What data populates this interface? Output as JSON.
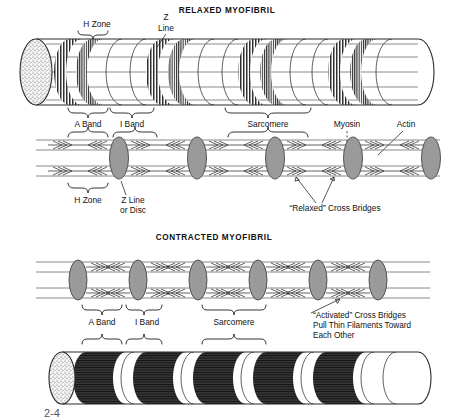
{
  "figure": {
    "number": "2-4"
  },
  "panels": {
    "relaxed": {
      "title": "RELAXED MYOFIBRIL",
      "labels": {
        "h_zone_top": "H Zone",
        "z_line_top_1": "Z",
        "z_line_top_2": "Line",
        "a_band": "A Band",
        "i_band": "I Band",
        "sarcomere": "Sarcomere",
        "myosin": "Myosin",
        "actin": "Actin",
        "h_zone_bottom": "H Zone",
        "z_line_bottom_1": "Z Line",
        "z_line_bottom_2": "or Disc",
        "cross_bridges": "“Relaxed” Cross Bridges"
      }
    },
    "contracted": {
      "title": "CONTRACTED MYOFIBRIL",
      "labels": {
        "a_band": "A Band",
        "i_band": "I Band",
        "sarcomere": "Sarcomere",
        "cross_bridges_1": "“Activated” Cross Bridges",
        "cross_bridges_2": "Pull Thin Filaments Toward",
        "cross_bridges_3": "Each Other"
      }
    }
  },
  "colors": {
    "ink": "#1a1a1a",
    "band_dark": "#2b2b2b",
    "z_line_gray": "#9a9a9a",
    "filament_gray": "#7a7a7a",
    "background": "#ffffff"
  },
  "geometry": {
    "relaxed_cylinder": {
      "x_start": 36,
      "x_end": 418,
      "y_center": 72,
      "radius_y": 33,
      "band_centers": [
        78,
        98,
        170,
        190,
        262,
        282,
        352,
        372
      ]
    },
    "contracted_cylinder": {
      "x_start": 62,
      "x_end": 418,
      "y_center": 378,
      "radius_y": 26,
      "band_centers": [
        100,
        140,
        182,
        222,
        264,
        304,
        346
      ]
    },
    "relaxed_filaments": {
      "y_center": 158,
      "half_height": 22,
      "z_positions": [
        118,
        196,
        274,
        352,
        420
      ],
      "x_start": 36
    },
    "contracted_filaments": {
      "y_center": 280,
      "half_height": 22,
      "z_positions": [
        78,
        138,
        198,
        258,
        318,
        378
      ],
      "x_start": 36
    }
  }
}
